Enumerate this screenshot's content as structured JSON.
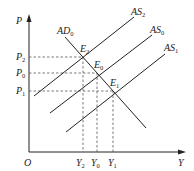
{
  "diagram": {
    "type": "AD-AS model",
    "axes": {
      "y_label": "P",
      "x_label": "Y",
      "origin_label": "O"
    },
    "price_levels": [
      {
        "base": "P",
        "sub": "2"
      },
      {
        "base": "P",
        "sub": "0"
      },
      {
        "base": "P",
        "sub": "1"
      }
    ],
    "output_levels": [
      {
        "base": "Y",
        "sub": "2"
      },
      {
        "base": "Y",
        "sub": "0"
      },
      {
        "base": "Y",
        "sub": "1"
      }
    ],
    "curves": {
      "ad": {
        "base": "AD",
        "sub": "0"
      },
      "as2": {
        "base": "AS",
        "sub": "2"
      },
      "as0": {
        "base": "AS",
        "sub": "0"
      },
      "as1": {
        "base": "AS",
        "sub": "1"
      }
    },
    "equilibria": {
      "e2": {
        "base": "E",
        "sub": "2"
      },
      "e0": {
        "base": "E",
        "sub": "0"
      },
      "e1": {
        "base": "E",
        "sub": "1"
      }
    },
    "colors": {
      "line": "#222222",
      "dashed": "#555555"
    }
  }
}
